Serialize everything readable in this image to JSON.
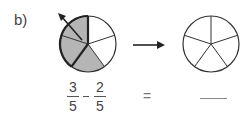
{
  "label": "b)",
  "left_fraction": {
    "numerator": "3",
    "denominator": "5"
  },
  "operator": "−",
  "right_fraction": {
    "numerator": "2",
    "denominator": "5"
  },
  "equals": "=",
  "answer_blank": "",
  "pie_left": {
    "parts": 5,
    "shaded": 3,
    "removed_marked": 2
  },
  "pie_right": {
    "parts": 5,
    "shaded": 0
  },
  "colors": {
    "shade": "#b5b5b5",
    "stroke": "#333333"
  }
}
